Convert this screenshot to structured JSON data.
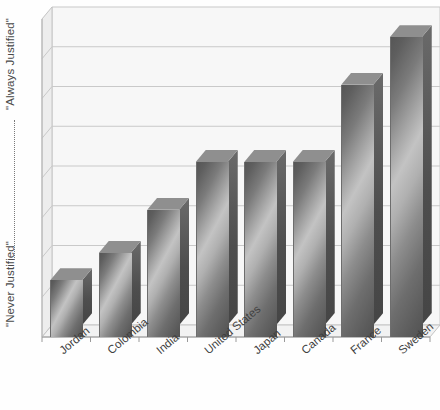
{
  "chart_data": {
    "type": "bar",
    "title": "",
    "subtitle": "",
    "xlabel": "",
    "ylabel": "",
    "y_axis_top_label": "\"Always Justified\"",
    "y_axis_bottom_label": "\"Never Justified\"",
    "grid": true,
    "gridlines": 7,
    "legend": "none",
    "style": "3d-column",
    "ylim": [
      0,
      7
    ],
    "categories": [
      "Jordan",
      "Colombia",
      "India",
      "United States",
      "Japan",
      "Canada",
      "France",
      "Sweden"
    ],
    "values": [
      1.25,
      1.85,
      2.8,
      3.85,
      3.85,
      3.85,
      5.55,
      6.6
    ],
    "tick_labels": [],
    "annotations": []
  },
  "axes": {
    "y_top_label": "\"Always Justified\"",
    "y_bottom_label": "\"Never Justified\""
  },
  "labels": {
    "x": [
      "Jordan",
      "Colombia",
      "India",
      "United States",
      "Japan",
      "Canada",
      "France",
      "Sweden"
    ]
  },
  "colors": {
    "bar_light": "#c3c3c3",
    "bar_mid": "#8d8d8d",
    "bar_dark": "#525252",
    "bar_side": "#4e4e4e",
    "bar_top": "#8f8f8f",
    "gridline": "#c9c9c9",
    "axis": "#9a9a9a",
    "plot_face": "#f4f4f4",
    "plot_wall": "#eaeaea",
    "text": "#3f3f3f"
  }
}
